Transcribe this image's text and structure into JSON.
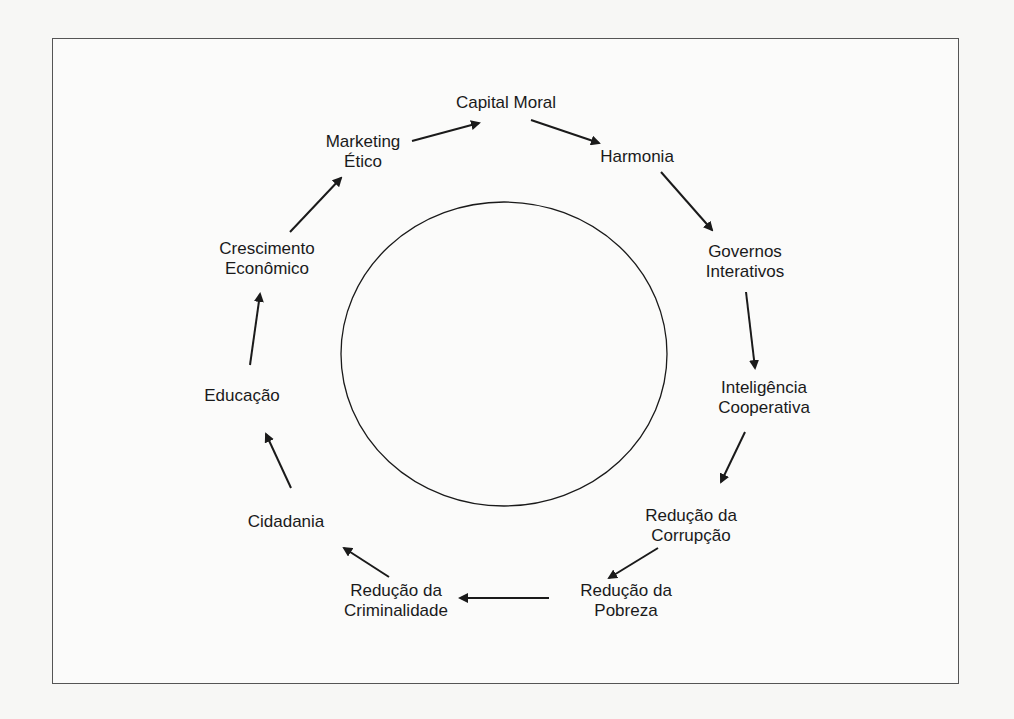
{
  "diagram": {
    "type": "cycle",
    "center_shape": "ellipse",
    "line_color": "#1a1a1a",
    "nodes": [
      {
        "id": "capital-moral",
        "lines": [
          "Capital Moral"
        ],
        "x": 506,
        "y": 103
      },
      {
        "id": "harmonia",
        "lines": [
          "Harmonia"
        ],
        "x": 637,
        "y": 157
      },
      {
        "id": "governos-interativos",
        "lines": [
          "Governos",
          "Interativos"
        ],
        "x": 745,
        "y": 262
      },
      {
        "id": "inteligencia-cooperativa",
        "lines": [
          "Inteligência",
          "Cooperativa"
        ],
        "x": 764,
        "y": 398
      },
      {
        "id": "reducao-corrupcao",
        "lines": [
          "Redução da",
          "Corrupção"
        ],
        "x": 691,
        "y": 536
      },
      {
        "id": "reducao-pobreza",
        "lines": [
          "Redução da",
          "Pobreza"
        ],
        "x": 626,
        "y": 601
      },
      {
        "id": "reducao-criminalidade",
        "lines": [
          "Redução da",
          "Criminalidade"
        ],
        "x": 396,
        "y": 601
      },
      {
        "id": "cidadania",
        "lines": [
          "Cidadania"
        ],
        "x": 275,
        "y": 522
      },
      {
        "id": "educacao",
        "lines": [
          "Educação"
        ],
        "x": 242,
        "y": 396
      },
      {
        "id": "crescimento-economico",
        "lines": [
          "Crescimento",
          "Econômico"
        ],
        "x": 253,
        "y": 259
      },
      {
        "id": "marketing-etico",
        "lines": [
          "Marketing",
          "Ético"
        ],
        "x": 360,
        "y": 152
      }
    ],
    "edges": [
      {
        "from": "marketing-etico",
        "to": "capital-moral"
      },
      {
        "from": "capital-moral",
        "to": "harmonia"
      },
      {
        "from": "harmonia",
        "to": "governos-interativos"
      },
      {
        "from": "governos-interativos",
        "to": "inteligencia-cooperativa"
      },
      {
        "from": "inteligencia-cooperativa",
        "to": "reducao-corrupcao"
      },
      {
        "from": "reducao-corrupcao",
        "to": "reducao-pobreza"
      },
      {
        "from": "reducao-pobreza",
        "to": "reducao-criminalidade"
      },
      {
        "from": "reducao-criminalidade",
        "to": "cidadania"
      },
      {
        "from": "cidadania",
        "to": "educacao"
      },
      {
        "from": "educacao",
        "to": "crescimento-economico"
      },
      {
        "from": "crescimento-economico",
        "to": "marketing-etico"
      }
    ]
  }
}
